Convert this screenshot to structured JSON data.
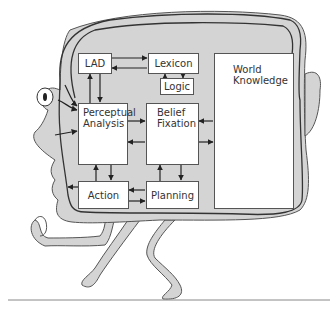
{
  "diagram": {
    "type": "cognitive-architecture-cartoon",
    "figure": "head-shaped person walking, containing cognitive modules",
    "colors": {
      "head_fill": "#d4d4d4",
      "outline": "#333333",
      "box_fill": "#ffffff",
      "arrow": "#222222"
    },
    "nodes": [
      {
        "id": "lad",
        "label": "LAD"
      },
      {
        "id": "lexicon",
        "label": "Lexicon"
      },
      {
        "id": "logic",
        "label": "Logic"
      },
      {
        "id": "perceptual",
        "label_line1": "Perceptual",
        "label_line2": "Analysis"
      },
      {
        "id": "belief",
        "label_line1": "Belief",
        "label_line2": "Fixation"
      },
      {
        "id": "world",
        "label_line1": "World",
        "label_line2": "Knowledge"
      },
      {
        "id": "action",
        "label": "Action"
      },
      {
        "id": "planning",
        "label": "Planning"
      }
    ],
    "edges": [
      {
        "from": "lad",
        "to": "lexicon"
      },
      {
        "from": "lexicon",
        "to": "lad"
      },
      {
        "from": "lexicon",
        "to": "logic"
      },
      {
        "from": "logic",
        "to": "lexicon"
      },
      {
        "from": "lad",
        "to": "perceptual"
      },
      {
        "from": "perceptual",
        "to": "lad"
      },
      {
        "from": "perceptual",
        "to": "belief"
      },
      {
        "from": "belief",
        "to": "perceptual"
      },
      {
        "from": "world",
        "to": "belief"
      },
      {
        "from": "belief",
        "to": "world"
      },
      {
        "from": "perceptual",
        "to": "action"
      },
      {
        "from": "action",
        "to": "perceptual"
      },
      {
        "from": "belief",
        "to": "planning"
      },
      {
        "from": "planning",
        "to": "belief"
      },
      {
        "from": "planning",
        "to": "action"
      },
      {
        "from": "action",
        "to": "planning"
      },
      {
        "from": "eye",
        "to": "perceptual"
      },
      {
        "from": "face",
        "to": "perceptual"
      },
      {
        "from": "action",
        "to": "mouth"
      }
    ]
  }
}
